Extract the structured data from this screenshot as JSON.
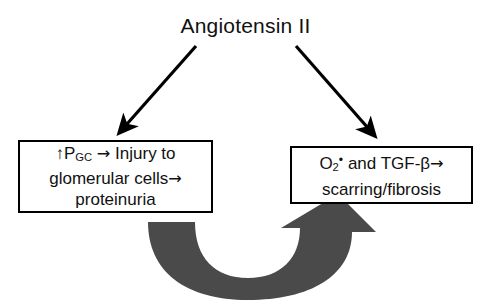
{
  "diagram": {
    "type": "flow-diagram",
    "topic": "Angiotensin II mediated renal injury pathway",
    "title": "Angiotensin II",
    "background_color": "#ffffff",
    "text_color": "#111111",
    "box_border_color": "#000000",
    "feedback_arrow_color": "#4a4a4a"
  },
  "nodes": {
    "left": {
      "id": "node-glomerular-injury",
      "full_text": "↑PGC → Injury to glomerular cells→ proteinuria",
      "line1_prefix": "↑P",
      "line1_subscript": "GC",
      "line1_arrow": "→",
      "line1_suffix": "Injury to",
      "line2": "glomerular cells",
      "line2_arrow": "→",
      "line3": "proteinuria"
    },
    "right": {
      "id": "node-oxidative-fibrosis",
      "full_text": "O2• and TGF-β→ scarring/fibrosis",
      "line1_base": "O",
      "line1_subscript": "2",
      "line1_superscript": "•",
      "line1_mid": " and TGF-β",
      "line1_arrow": "→",
      "line2": "scarring/fibrosis"
    }
  },
  "edges": [
    {
      "id": "edge-title-to-left",
      "label": "",
      "from": "Angiotensin II",
      "to": "left box",
      "style": "solid-black-arrow",
      "direction": "down-left"
    },
    {
      "id": "edge-title-to-right",
      "label": "",
      "from": "Angiotensin II",
      "to": "right box",
      "style": "solid-black-arrow",
      "direction": "down-right"
    },
    {
      "id": "edge-feedback-loop",
      "label": "",
      "from": "left box",
      "to": "right box",
      "style": "thick-gray-curved-arrow",
      "direction": "u-shaped-clockwise"
    }
  ]
}
